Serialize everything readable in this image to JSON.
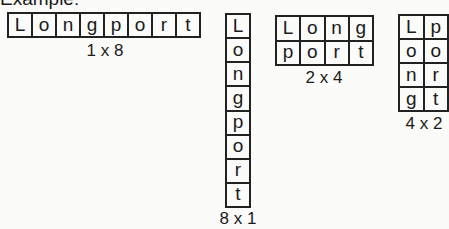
{
  "heading": "Example:",
  "word": "Longport",
  "arrangements": [
    {
      "label": "1 x 8",
      "rows": 1,
      "cols": 8,
      "cells": [
        "L",
        "o",
        "n",
        "g",
        "p",
        "o",
        "r",
        "t"
      ]
    },
    {
      "label": "8 x 1",
      "rows": 8,
      "cols": 1,
      "cells": [
        "L",
        "o",
        "n",
        "g",
        "p",
        "o",
        "r",
        "t"
      ]
    },
    {
      "label": "2 x 4",
      "rows": 2,
      "cols": 4,
      "cells": [
        "L",
        "o",
        "n",
        "g",
        "p",
        "o",
        "r",
        "t"
      ]
    },
    {
      "label": "4 x 2",
      "rows": 4,
      "cols": 2,
      "cells": [
        "L",
        "p",
        "o",
        "o",
        "n",
        "r",
        "g",
        "t"
      ]
    }
  ]
}
